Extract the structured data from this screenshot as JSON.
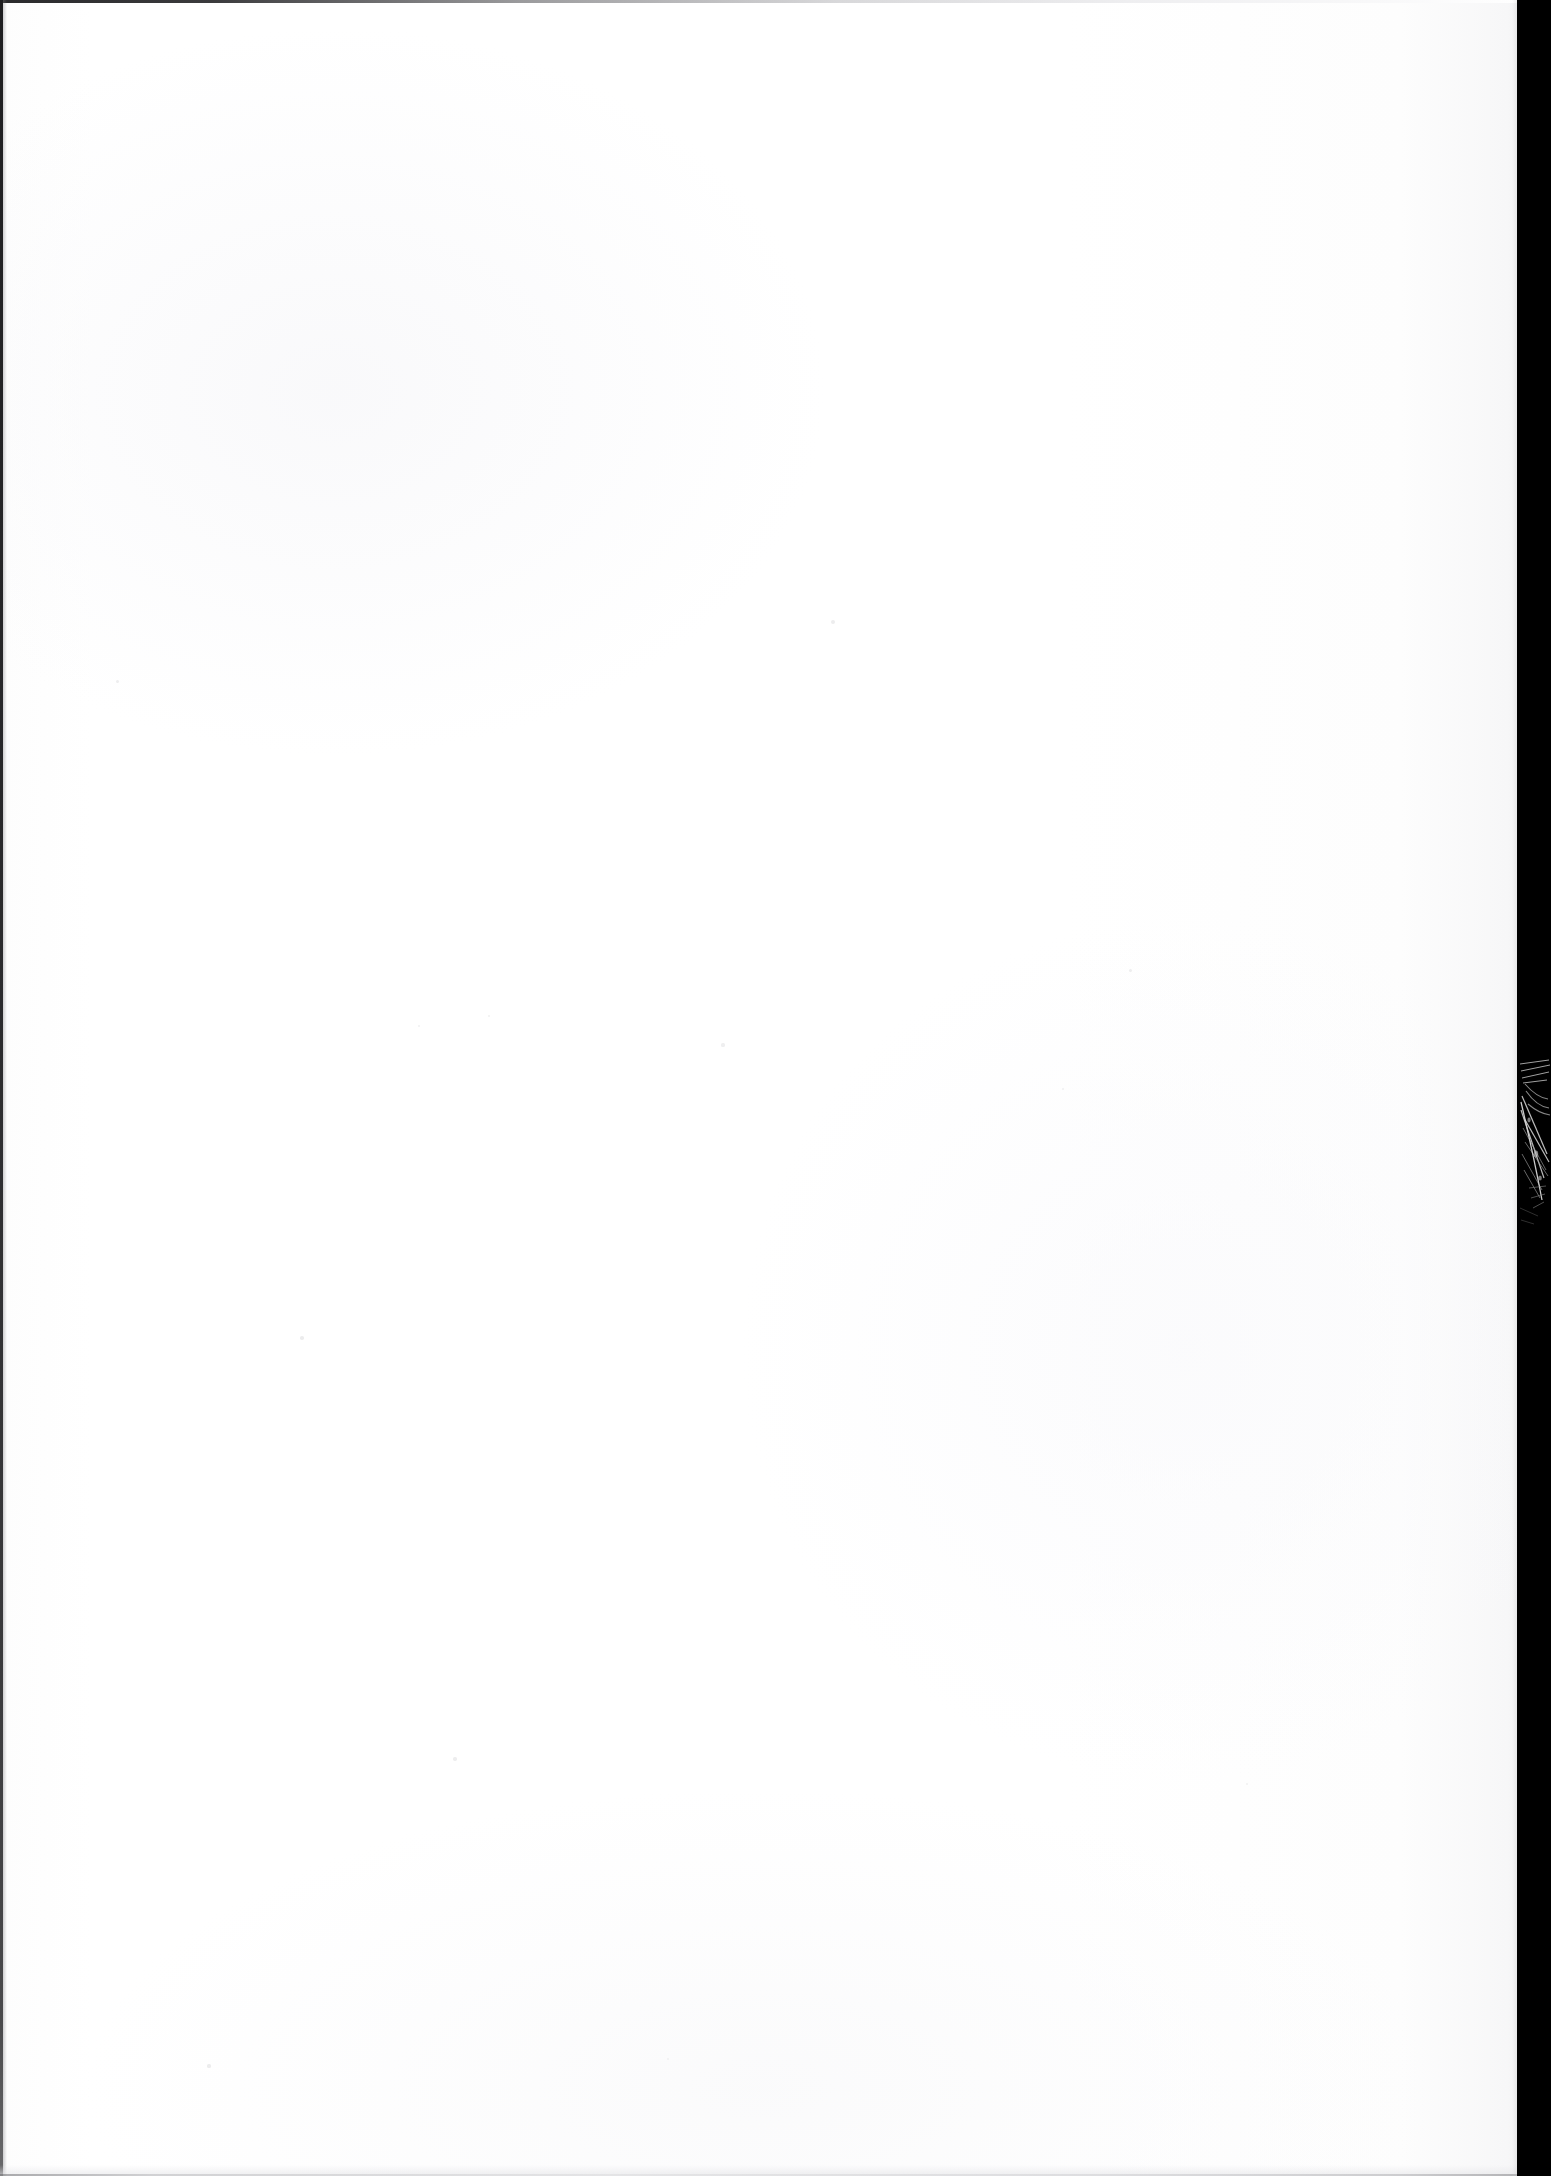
{
  "document": {
    "kind": "scanned-page-image",
    "page_label": "",
    "visible_text": "",
    "body_text": ""
  },
  "canvas": {
    "width": 1551,
    "height": 2176,
    "background_color": "#ffffff"
  },
  "page_sheet": {
    "name": "paper-sheet",
    "left": 0,
    "top": 0,
    "width": 1522,
    "height": 2176,
    "paper_color": "#ffffff",
    "shadow_tone_color": "#f2f2f3",
    "content": ""
  },
  "gutter_strip": {
    "name": "scanner-background-strip",
    "color": "#000000",
    "left": 1517,
    "width": 34,
    "height": 2176,
    "edge_softening_color": "#5a5a5a"
  },
  "crease_artifact": {
    "name": "crease-scratch",
    "left": 1516,
    "top": 1058,
    "width": 35,
    "height": 186,
    "stroke_color": "#b8b8b8",
    "description": ""
  },
  "edges": {
    "top_line_color": "#2a2a2c",
    "top_line_height": 3,
    "left_line_color": "#1e1e20",
    "left_line_width": 3,
    "bottom_line_color": "#c2c2c5",
    "bottom_line_height": 2
  },
  "specks": [
    {
      "x": 833,
      "y": 622,
      "r": 2.0,
      "color": "#ededee"
    },
    {
      "x": 723,
      "y": 1045,
      "r": 1.6,
      "color": "#efeff0"
    },
    {
      "x": 489,
      "y": 1016,
      "r": 1.4,
      "color": "#f0f0f1"
    },
    {
      "x": 302,
      "y": 1338,
      "r": 1.8,
      "color": "#ececed"
    },
    {
      "x": 1130,
      "y": 970,
      "r": 1.5,
      "color": "#eeeeef"
    },
    {
      "x": 455,
      "y": 1759,
      "r": 1.7,
      "color": "#ededee"
    },
    {
      "x": 419,
      "y": 1026,
      "r": 1.3,
      "color": "#f1f1f2"
    },
    {
      "x": 1063,
      "y": 1089,
      "r": 1.4,
      "color": "#efeff0"
    },
    {
      "x": 209,
      "y": 2066,
      "r": 1.6,
      "color": "#ececed"
    },
    {
      "x": 117,
      "y": 681,
      "r": 1.5,
      "color": "#eeeeef"
    },
    {
      "x": 1247,
      "y": 1784,
      "r": 1.4,
      "color": "#f0f0f1"
    },
    {
      "x": 668,
      "y": 2059,
      "r": 1.3,
      "color": "#f1f1f2"
    }
  ]
}
